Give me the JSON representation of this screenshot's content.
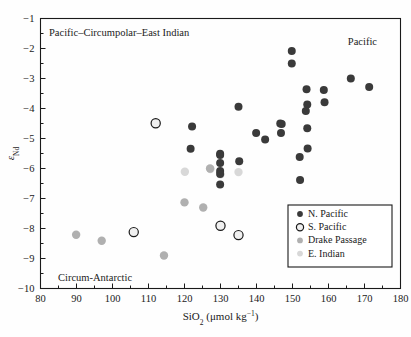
{
  "figure": {
    "background": "#fefefe",
    "frame_color": "#1a1a1a"
  },
  "annotations": {
    "top_left": "Pacific–Circumpolar–East Indian",
    "top_right": "Pacific",
    "bottom_left": "Circum-Antarctic"
  },
  "legend": {
    "entries": [
      {
        "label": "N. Pacific",
        "marker": "filled-circle",
        "color": "#3a3a3a",
        "size": 6
      },
      {
        "label": "S. Pacific",
        "marker": "open-circle",
        "color": "#f0f0f0",
        "edge": "#1a1a1a",
        "size": 8
      },
      {
        "label": "Drake Passage",
        "marker": "filled-circle",
        "color": "#b0b0b0",
        "size": 7
      },
      {
        "label": "E. Indian",
        "marker": "filled-circle",
        "color": "#d8d8d8",
        "size": 7
      }
    ],
    "border_color": "#1a1a1a"
  },
  "axis": {
    "x": {
      "label_main": "SiO",
      "label_sub": "2",
      "label_unit_open": " (μmol kg",
      "label_unit_sup": "−1",
      "label_unit_close": ")",
      "min": 80,
      "max": 180,
      "major_step": 10,
      "minor_step": 5,
      "ticks": [
        "80",
        "90",
        "100",
        "110",
        "120",
        "130",
        "140",
        "150",
        "160",
        "170",
        "180"
      ]
    },
    "y": {
      "label_main": "ε",
      "label_sub": "Nd",
      "min": -10,
      "max": -1,
      "major_step": 1,
      "minor_step": 0.5,
      "ticks": [
        "−1",
        "−2",
        "−3",
        "−4",
        "−5",
        "−6",
        "−7",
        "−8",
        "−9",
        "−10"
      ]
    }
  },
  "chart_data": {
    "type": "scatter",
    "title": "",
    "xlabel": "SiO2 (μmol kg−1)",
    "ylabel": "εNd",
    "xlim": [
      80,
      180
    ],
    "ylim": [
      -10,
      -1
    ],
    "grid": false,
    "legend_position": "lower-right-inside",
    "series": [
      {
        "name": "N. Pacific",
        "marker": "filled-circle",
        "color": "#3a3a3a",
        "points": [
          [
            149.8,
            -2.08
          ],
          [
            149.8,
            -2.5
          ],
          [
            166.2,
            -3.0
          ],
          [
            171.3,
            -3.28
          ],
          [
            153.9,
            -3.36
          ],
          [
            158.7,
            -3.38
          ],
          [
            158.9,
            -3.79
          ],
          [
            154.1,
            -3.87
          ],
          [
            135.0,
            -3.94
          ],
          [
            153.7,
            -4.08
          ],
          [
            146.6,
            -4.5
          ],
          [
            147.0,
            -4.52
          ],
          [
            154.1,
            -4.66
          ],
          [
            122.1,
            -4.6
          ],
          [
            139.9,
            -4.82
          ],
          [
            146.8,
            -4.82
          ],
          [
            142.4,
            -5.03
          ],
          [
            154.2,
            -5.33
          ],
          [
            121.7,
            -5.34
          ],
          [
            129.9,
            -5.51
          ],
          [
            129.9,
            -5.55
          ],
          [
            152.0,
            -5.62
          ],
          [
            129.9,
            -5.82
          ],
          [
            135.2,
            -5.76
          ],
          [
            129.9,
            -6.08
          ],
          [
            129.9,
            -6.18
          ],
          [
            129.9,
            -6.53
          ],
          [
            152.1,
            -6.38
          ]
        ]
      },
      {
        "name": "S. Pacific",
        "marker": "open-circle",
        "color": "#f0f0f0",
        "edge": "#1a1a1a",
        "points": [
          [
            112.0,
            -4.49
          ],
          [
            105.9,
            -8.12
          ],
          [
            130.0,
            -7.91
          ],
          [
            135.0,
            -8.22
          ]
        ]
      },
      {
        "name": "Drake Passage",
        "marker": "filled-circle",
        "color": "#b0b0b0",
        "points": [
          [
            89.9,
            -8.21
          ],
          [
            97.0,
            -8.41
          ],
          [
            114.3,
            -8.9
          ],
          [
            120.0,
            -7.13
          ],
          [
            125.2,
            -7.3
          ],
          [
            127.1,
            -6.0
          ]
        ]
      },
      {
        "name": "E. Indian",
        "marker": "filled-circle",
        "color": "#d8d8d8",
        "points": [
          [
            120.1,
            -6.11
          ],
          [
            127.2,
            -6.02
          ],
          [
            130.0,
            -6.19
          ],
          [
            135.0,
            -6.12
          ]
        ]
      }
    ]
  }
}
